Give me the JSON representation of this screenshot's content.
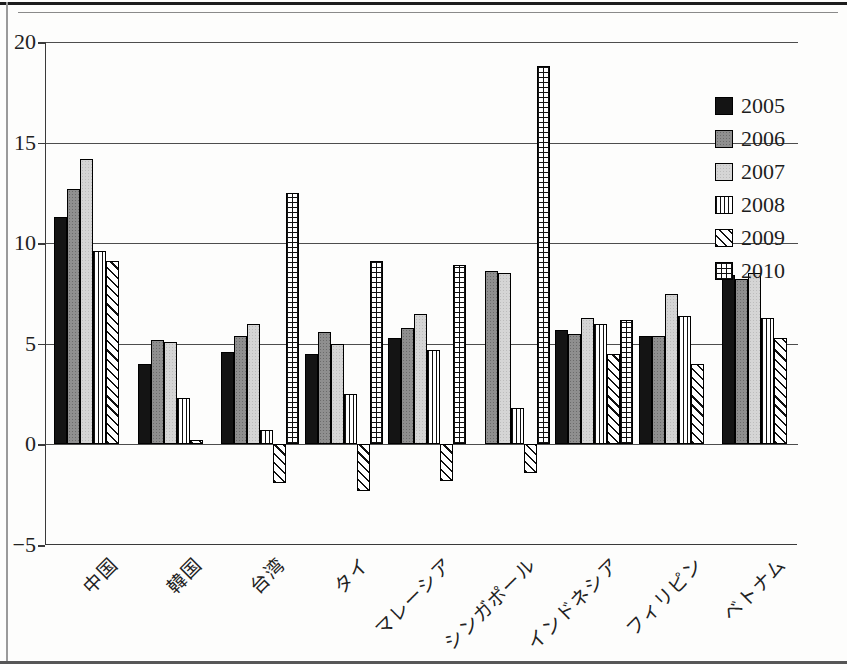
{
  "figure_type": "scanned-book-bar-chart",
  "chart_data": {
    "type": "bar",
    "title": "",
    "xlabel": "",
    "ylabel": "",
    "categories": [
      "中国",
      "韓国",
      "台湾",
      "タイ",
      "マレーシア",
      "シンガポール",
      "インドネシア",
      "フィリピン",
      "ベトナム"
    ],
    "series": [
      {
        "name": "2005",
        "pattern": "solid-black",
        "values": [
          11.3,
          4.0,
          4.6,
          4.5,
          5.3,
          null,
          5.7,
          5.4,
          8.4
        ]
      },
      {
        "name": "2006",
        "pattern": "halftone-dark-gray",
        "values": [
          12.7,
          5.2,
          5.4,
          5.6,
          5.8,
          8.6,
          5.5,
          5.4,
          8.2
        ]
      },
      {
        "name": "2007",
        "pattern": "halftone-light-gray",
        "values": [
          14.2,
          5.1,
          6.0,
          5.0,
          6.5,
          8.5,
          6.3,
          7.5,
          8.5
        ]
      },
      {
        "name": "2008",
        "pattern": "vertical-stripes",
        "values": [
          9.6,
          2.3,
          0.7,
          2.5,
          4.7,
          1.8,
          6.0,
          6.4,
          6.3
        ]
      },
      {
        "name": "2009",
        "pattern": "diagonal-stripes",
        "values": [
          9.1,
          0.2,
          -1.9,
          -2.3,
          -1.8,
          -1.4,
          4.5,
          4.0,
          5.3
        ]
      },
      {
        "name": "2010",
        "pattern": "grid-crosshatch",
        "values": [
          null,
          null,
          12.5,
          9.1,
          8.9,
          18.8,
          6.2,
          null,
          null
        ]
      }
    ],
    "ylim": [
      -5,
      20
    ],
    "yticks": [
      20,
      15,
      10,
      5,
      0,
      -5
    ],
    "ytick_labels": [
      "20",
      "15",
      "10",
      "5",
      "0",
      "−5"
    ],
    "grid": "horizontal",
    "legend_position": "top-right"
  },
  "colors": {
    "bar_black": "#141414",
    "bar_dark_gray": "#8f8f8f",
    "bar_light_gray": "#d5d5d5",
    "pattern_line": "#111111",
    "axis_line": "#3a3a3a",
    "background": "#fdfdfc"
  }
}
